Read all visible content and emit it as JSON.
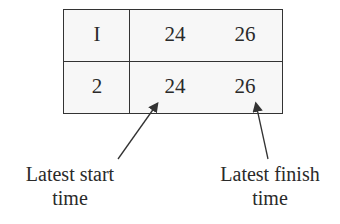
{
  "table": {
    "rows": [
      {
        "id": "I",
        "start": "24",
        "finish": "26"
      },
      {
        "id": "2",
        "start": "24",
        "finish": "26"
      }
    ]
  },
  "annotations": {
    "left": {
      "line1": "Latest start",
      "line2": "time"
    },
    "right": {
      "line1": "Latest finish",
      "line2": "time"
    }
  }
}
